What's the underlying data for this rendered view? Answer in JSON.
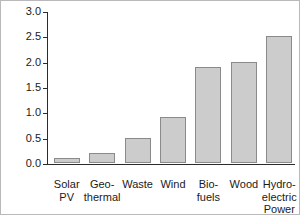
{
  "chart_data": {
    "type": "bar",
    "title": "",
    "xlabel": "",
    "ylabel": "Quadrillion BTU",
    "categories": [
      "Solar PV",
      "Geo-thermal",
      "Waste",
      "Wind",
      "Biofuels",
      "Wood",
      "Hydro-electric Power"
    ],
    "category_labels_wrapped": [
      "Solar\nPV",
      "Geo-\nthermal",
      "Waste",
      "Wind",
      "Bio-\nfuels",
      "Wood",
      "Hydro-\nelectric\nPower"
    ],
    "values": [
      0.1,
      0.2,
      0.5,
      0.9,
      1.9,
      2.0,
      2.5
    ],
    "ylim": [
      0.0,
      3.0
    ],
    "ytick_values": [
      0.0,
      0.5,
      1.0,
      1.5,
      2.0,
      2.5,
      3.0
    ],
    "ytick_labels": [
      "0.0",
      "0.5",
      "1.0",
      "1.5",
      "2.0",
      "2.5",
      "3.0"
    ],
    "grid": false,
    "legend": false,
    "bar_fill_color": "#cccccc",
    "bar_border_color": "#8a8a8a",
    "axis_color": "#2b2b2b",
    "text_color": "#1a1a1a"
  }
}
